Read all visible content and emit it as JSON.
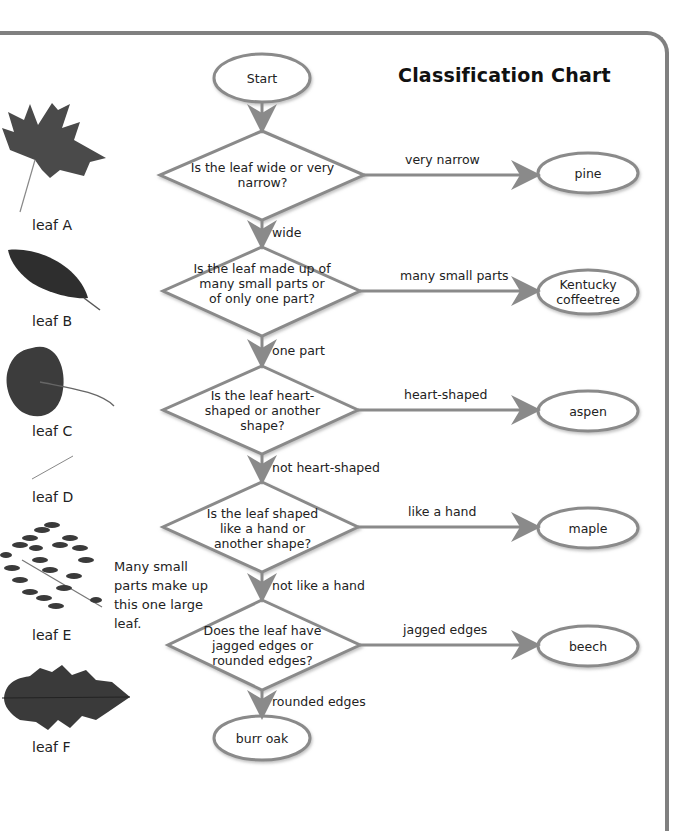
{
  "title": "Classification Chart",
  "leaves": [
    {
      "label": "leaf A",
      "shape": "maple-lobed"
    },
    {
      "label": "leaf B",
      "shape": "elliptic-serrate"
    },
    {
      "label": "leaf C",
      "shape": "heart-round"
    },
    {
      "label": "leaf D",
      "shape": "needle"
    },
    {
      "label": "leaf E",
      "shape": "compound-many-leaflets"
    },
    {
      "label": "leaf F",
      "shape": "oak-rounded-lobes"
    }
  ],
  "note": "Many small parts make up this one large leaf.",
  "flow": {
    "start": "Start",
    "questions": [
      {
        "text": "Is the leaf wide or very narrow?",
        "yes_label": "very narrow",
        "yes_result": "pine",
        "no_label": "wide"
      },
      {
        "text": "Is the leaf made up of many small parts or of only one part?",
        "yes_label": "many small parts",
        "yes_result": "Kentucky coffeetree",
        "no_label": "one part"
      },
      {
        "text": "Is the leaf heart-shaped or another shape?",
        "yes_label": "heart-shaped",
        "yes_result": "aspen",
        "no_label": "not heart-shaped"
      },
      {
        "text": "Is the leaf shaped like a hand or another shape?",
        "yes_label": "like a hand",
        "yes_result": "maple",
        "no_label": "not like a hand"
      },
      {
        "text": "Does the leaf have jagged edges or rounded edges?",
        "yes_label": "jagged edges",
        "yes_result": "beech",
        "no_label": "rounded edges"
      }
    ],
    "end": "burr oak"
  },
  "colors": {
    "line": "#8a8a8a",
    "frame": "#808080",
    "leaf": "#3a3a3a",
    "text": "#222222"
  }
}
